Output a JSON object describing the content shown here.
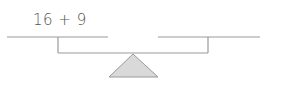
{
  "balance": {
    "left_pan_expression": "16 + 9",
    "right_pan_expression": "",
    "line_color": "#9a9a9a",
    "fulcrum_fill": "#d9d9d9",
    "fulcrum_stroke": "#999999"
  }
}
